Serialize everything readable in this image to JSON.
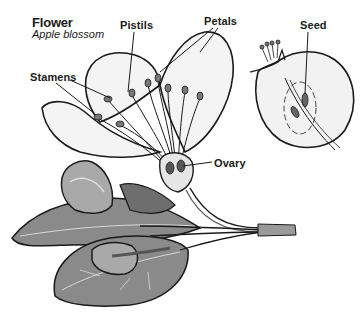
{
  "diagram": {
    "title": "Flower",
    "subtitle": "Apple blossom",
    "labels": {
      "pistils": "Pistils",
      "petals": "Petals",
      "seed": "Seed",
      "stamens": "Stamens",
      "ovary": "Ovary"
    },
    "illustrations": [
      {
        "name": "flower-cross-section",
        "description": "Apple blossom with petals, stamens, pistils and ovary"
      },
      {
        "name": "fruit-cross-section",
        "description": "Half apple showing seed"
      },
      {
        "name": "leaves-and-buds",
        "description": "Leaves, buds and stem"
      }
    ],
    "colors": {
      "line": "#1a1a1a",
      "petal_fill": "#f4f4f4",
      "leaf_fill": "#8a8a8a",
      "leaf_dark": "#6e6e6e",
      "bud_fill": "#a9a9a9",
      "background": "#ffffff"
    }
  }
}
